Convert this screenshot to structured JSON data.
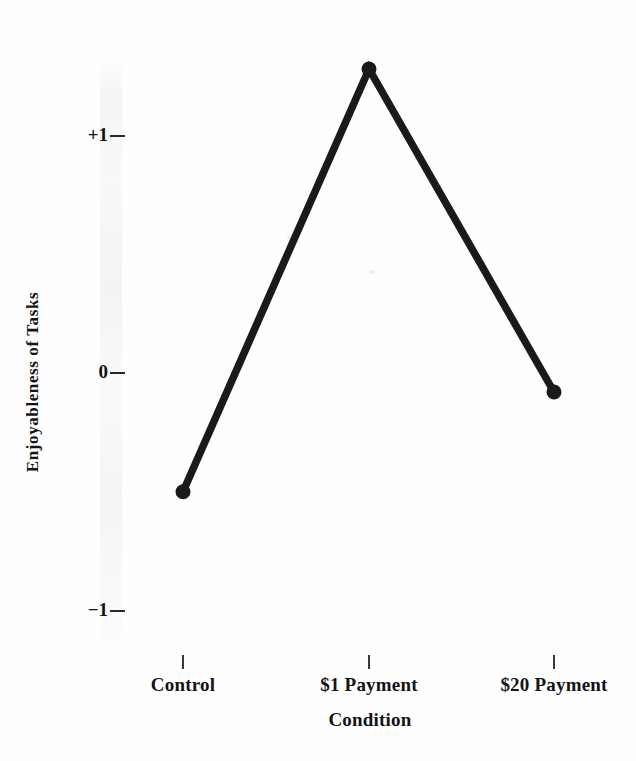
{
  "chart_data": {
    "type": "line",
    "title": "",
    "subtitle": "",
    "xlabel": "Condition",
    "ylabel": "Enjoyableness of Tasks",
    "categories": [
      "Control",
      "$1 Payment",
      "$20 Payment"
    ],
    "values": [
      -0.5,
      1.28,
      -0.08
    ],
    "series": [
      {
        "name": "Enjoyableness of Tasks",
        "values": [
          -0.5,
          1.28,
          -0.08
        ]
      }
    ],
    "ylim": [
      -1.45,
      1.45
    ],
    "y_tick_labels": [
      "+1",
      "0",
      "−1"
    ],
    "y_tick_values": [
      1,
      0,
      -1
    ],
    "grid": false,
    "legend": false,
    "legend_position": "none",
    "marker": "filled-circle",
    "line_color": "#1a1a1a",
    "marker_color": "#1a1a1a",
    "background_color": "#fefefe",
    "annotations": []
  },
  "axes": {
    "y": {
      "title": "Enjoyableness of Tasks",
      "ticks": [
        {
          "label": "+1",
          "value": 1
        },
        {
          "label": "0",
          "value": 0
        },
        {
          "label": "−1",
          "value": -1
        }
      ]
    },
    "x": {
      "title": "Condition",
      "ticks": [
        {
          "label": "Control",
          "value": -0.5
        },
        {
          "label": "$1 Payment",
          "value": 1.28
        },
        {
          "label": "$20 Payment",
          "value": -0.08
        }
      ]
    }
  }
}
